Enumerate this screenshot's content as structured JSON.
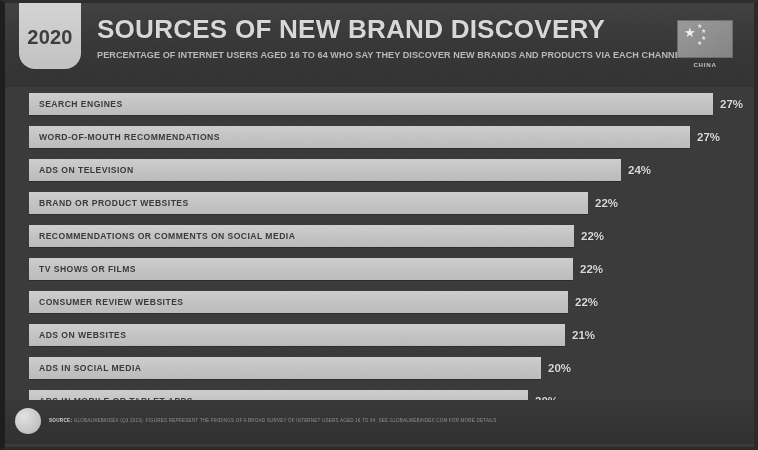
{
  "header": {
    "year": "2020",
    "title": "SOURCES OF NEW BRAND DISCOVERY",
    "subtitle": "PERCENTAGE OF INTERNET USERS AGED 16 TO 64 WHO SAY THEY DISCOVER NEW BRANDS AND PRODUCTS VIA EACH CHANNEL",
    "flag_caption": "CHINA",
    "flag_icon": "china-flag-icon"
  },
  "footer": {
    "source_keyword": "SOURCE:",
    "source_text": "GLOBALWEBINDEX (Q3 2019). FIGURES REPRESENT THE FINDINGS OF A BROAD SURVEY OF INTERNET USERS AGED 16 TO 64. SEE GLOBALWEBINDEX.COM FOR MORE DETAILS.",
    "logo_icon": "datareportal-logo-icon"
  },
  "colors": {
    "background": "#3b3b3b",
    "bar_fill": "#c6c6c6",
    "bar_label": "#3a3a3a",
    "value_label": "#dcdcdc",
    "title": "#d8d8d8",
    "badge": "#c9c9c9"
  },
  "chart_data": {
    "type": "bar",
    "title": "SOURCES OF NEW BRAND DISCOVERY",
    "subtitle": "PERCENTAGE OF INTERNET USERS AGED 16 TO 64 WHO SAY THEY DISCOVER NEW BRANDS AND PRODUCTS VIA EACH CHANNEL",
    "orientation": "horizontal",
    "xlabel": "",
    "ylabel": "",
    "xlim": [
      0,
      29
    ],
    "grid": false,
    "legend": false,
    "categories": [
      "SEARCH ENGINES",
      "WORD-OF-MOUTH RECOMMENDATIONS",
      "ADS ON TELEVISION",
      "BRAND OR PRODUCT WEBSITES",
      "RECOMMENDATIONS OR COMMENTS ON SOCIAL MEDIA",
      "TV SHOWS OR FILMS",
      "CONSUMER REVIEW WEBSITES",
      "ADS ON WEBSITES",
      "ADS IN SOCIAL MEDIA",
      "ADS IN MOBILE OR TABLET APPS"
    ],
    "values": [
      27,
      27,
      24,
      22,
      22,
      22,
      22,
      21,
      20,
      20
    ],
    "value_labels": [
      "27%",
      "27%",
      "24%",
      "22%",
      "22%",
      "22%",
      "22%",
      "21%",
      "20%",
      "20%"
    ],
    "bar_pixel_widths": [
      684,
      661,
      592,
      559,
      545,
      544,
      539,
      536,
      512,
      499
    ]
  }
}
